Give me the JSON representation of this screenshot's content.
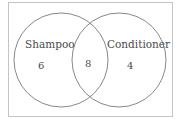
{
  "diagram": {
    "type": "venn",
    "colors": {
      "frame": "#bdbdbd",
      "circle": "#7a7a7a",
      "text": "#4a4a4a",
      "background": "#ffffff"
    },
    "sets": [
      {
        "name": "Shampoo",
        "only_count": "6"
      },
      {
        "name": "Conditioner",
        "only_count": "4"
      }
    ],
    "intersection_count": "8"
  }
}
